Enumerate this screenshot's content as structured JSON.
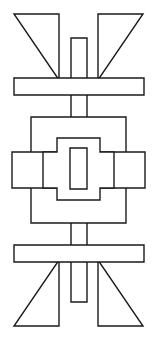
{
  "figure": {
    "canvas": {
      "width": 157,
      "height": 340,
      "background_color": "#ffffff"
    },
    "style": {
      "stroke_color": "#1a1a1a",
      "fill_color": "#ffffff",
      "stroke_width": 1.4
    },
    "shapes": [
      {
        "name": "top-left-triangle",
        "type": "polygon",
        "points": "14,14 59,14 59,80 14,14"
      },
      {
        "name": "top-right-triangle",
        "type": "polygon",
        "points": "143,14 98,14 98,80 143,14"
      },
      {
        "name": "bottom-left-triangle",
        "type": "polygon",
        "points": "14,326 59,326 59,260 14,326"
      },
      {
        "name": "bottom-right-triangle",
        "type": "polygon",
        "points": "143,326 98,326 98,260 143,326"
      },
      {
        "name": "vertical-stem",
        "type": "rect",
        "x": 71,
        "y": 38,
        "width": 16,
        "height": 264
      },
      {
        "name": "upper-horizontal-bar",
        "type": "rect",
        "x": 14,
        "y": 78,
        "width": 130,
        "height": 17
      },
      {
        "name": "lower-horizontal-bar",
        "type": "rect",
        "x": 14,
        "y": 245,
        "width": 130,
        "height": 17
      },
      {
        "name": "center-outer-box",
        "type": "rect",
        "x": 31,
        "y": 117,
        "width": 95,
        "height": 106
      },
      {
        "name": "left-wing-bar",
        "type": "rect",
        "x": 12,
        "y": 152,
        "width": 44,
        "height": 36
      },
      {
        "name": "right-wing-bar",
        "type": "rect",
        "x": 101,
        "y": 152,
        "width": 44,
        "height": 36
      },
      {
        "name": "center-stepped-ring",
        "type": "polygon",
        "points": "57,138 100,138 100,152 114,152 114,188 100,188 100,200 57,200 57,188 43,188 43,152 57,152"
      },
      {
        "name": "center-inner-rect",
        "type": "rect",
        "x": 70,
        "y": 148,
        "width": 17,
        "height": 41
      }
    ]
  }
}
